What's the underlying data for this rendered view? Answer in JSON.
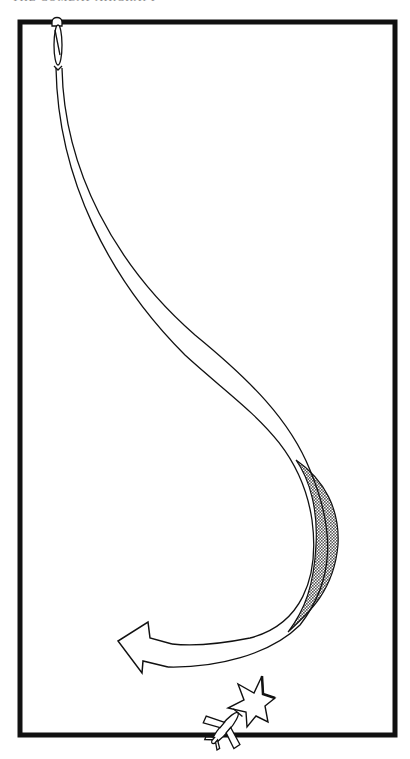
{
  "page": {
    "running_head": "THE COMBAT AIRCRAFT"
  },
  "diagram": {
    "type": "flight-maneuver-illustration",
    "frame": {
      "x": 20,
      "y": 22,
      "width": 375,
      "height": 713,
      "stroke": "#111111",
      "stroke_width": 5
    },
    "elements": [
      {
        "name": "attacking-aircraft",
        "description": "aircraft at top diving",
        "position": [
          58,
          45
        ]
      },
      {
        "name": "flight-path-ribbon",
        "description": "ribbon trail curving from top-left down and right"
      },
      {
        "name": "shaded-twist",
        "description": "dotted-shaded underside of ribbon during turn",
        "fill": "#9a9a9a"
      },
      {
        "name": "pull-out-arrow",
        "description": "open arrow pointing left at end of path",
        "position": [
          112,
          640
        ]
      },
      {
        "name": "explosion-burst",
        "description": "star burst indicating hit",
        "position": [
          250,
          698
        ]
      },
      {
        "name": "target-aircraft",
        "description": "aircraft at bottom edge",
        "position": [
          225,
          730
        ]
      }
    ],
    "colors": {
      "ink": "#111111",
      "shade": "#9a9a9a",
      "paper": "#ffffff"
    }
  }
}
